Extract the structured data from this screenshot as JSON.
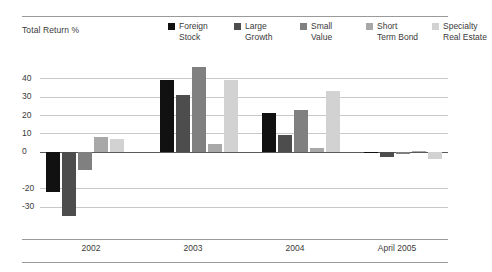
{
  "axis_title": "Total Return %",
  "legend": [
    {
      "label": "Foreign\nStock",
      "color": "#111111"
    },
    {
      "label": "Large\nGrowth",
      "color": "#4d4d4d"
    },
    {
      "label": "Small\nValue",
      "color": "#808080"
    },
    {
      "label": "Short\nTerm Bond",
      "color": "#a8a8a8"
    },
    {
      "label": "Specialty\nReal Estate",
      "color": "#d2d2d2"
    }
  ],
  "yticks": [
    "40",
    "30",
    "20",
    "10",
    "0",
    "-20",
    "-30"
  ],
  "xlabels": [
    "2002",
    "2003",
    "2004",
    "April 2005"
  ],
  "chart_data": {
    "type": "bar",
    "title": "",
    "subtitle": "",
    "xlabel": "",
    "ylabel": "Total Return %",
    "ylim": [
      -40,
      50
    ],
    "grid": true,
    "legend_position": "top-right",
    "categories": [
      "2002",
      "2003",
      "2004",
      "April 2005"
    ],
    "series": [
      {
        "name": "Foreign Stock",
        "color": "#111111",
        "values": [
          -22.0,
          39.0,
          21.0,
          -0.6
        ]
      },
      {
        "name": "Large Growth",
        "color": "#4d4d4d",
        "values": [
          -35.0,
          31.0,
          9.0,
          -3.0
        ]
      },
      {
        "name": "Small Value",
        "color": "#808080",
        "values": [
          -10.0,
          46.0,
          23.0,
          -1.5
        ]
      },
      {
        "name": "Short Term Bond",
        "color": "#a8a8a8",
        "values": [
          8.0,
          4.0,
          2.0,
          0.3
        ]
      },
      {
        "name": "Specialty Real Estate",
        "color": "#d2d2d2",
        "values": [
          7.0,
          39.0,
          33.0,
          -4.0
        ]
      }
    ],
    "ytick_values": [
      40,
      30,
      20,
      10,
      0,
      -20,
      -30
    ],
    "gridline_values": [
      40,
      30,
      20,
      10,
      0,
      -20,
      -30
    ]
  }
}
